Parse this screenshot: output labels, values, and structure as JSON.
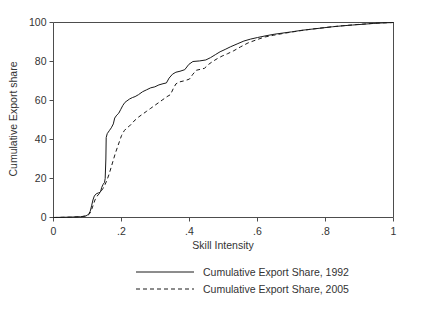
{
  "chart_data": {
    "type": "line",
    "title": "",
    "xlabel": "Skill Intensity",
    "ylabel": "Cumulative Export share",
    "xlim": [
      0,
      1
    ],
    "ylim": [
      0,
      100
    ],
    "xticks": [
      "0",
      ".2",
      ".4",
      ".6",
      ".8",
      "1"
    ],
    "xtick_values": [
      0,
      0.2,
      0.4,
      0.6,
      0.8,
      1
    ],
    "yticks": [
      "0",
      "20",
      "40",
      "60",
      "80",
      "100"
    ],
    "ytick_values": [
      0,
      20,
      40,
      60,
      80,
      100
    ],
    "grid": false,
    "legend_position": "below-axis",
    "line_color": "#1a1a1a",
    "background_color": "#ffffff",
    "series": [
      {
        "name": "Cumulative Export Share, 1992",
        "style": "solid",
        "points": [
          [
            0.0,
            0.0
          ],
          [
            0.05,
            0.2
          ],
          [
            0.08,
            0.4
          ],
          [
            0.095,
            0.8
          ],
          [
            0.1,
            1.2
          ],
          [
            0.104,
            2.0
          ],
          [
            0.108,
            3.2
          ],
          [
            0.112,
            6.0
          ],
          [
            0.116,
            9.0
          ],
          [
            0.12,
            11.0
          ],
          [
            0.126,
            12.2
          ],
          [
            0.132,
            12.6
          ],
          [
            0.138,
            13.0
          ],
          [
            0.142,
            15.5
          ],
          [
            0.146,
            17.0
          ],
          [
            0.15,
            18.0
          ],
          [
            0.152,
            20.0
          ],
          [
            0.154,
            30.0
          ],
          [
            0.155,
            41.0
          ],
          [
            0.158,
            43.0
          ],
          [
            0.164,
            44.5
          ],
          [
            0.17,
            46.0
          ],
          [
            0.176,
            48.0
          ],
          [
            0.18,
            51.0
          ],
          [
            0.186,
            52.5
          ],
          [
            0.192,
            53.5
          ],
          [
            0.198,
            55.5
          ],
          [
            0.204,
            57.5
          ],
          [
            0.21,
            59.0
          ],
          [
            0.216,
            59.8
          ],
          [
            0.224,
            60.8
          ],
          [
            0.232,
            61.5
          ],
          [
            0.24,
            62.0
          ],
          [
            0.25,
            63.0
          ],
          [
            0.262,
            64.5
          ],
          [
            0.274,
            65.5
          ],
          [
            0.286,
            66.5
          ],
          [
            0.298,
            67.0
          ],
          [
            0.31,
            68.0
          ],
          [
            0.322,
            68.6
          ],
          [
            0.332,
            69.0
          ],
          [
            0.34,
            71.5
          ],
          [
            0.35,
            73.5
          ],
          [
            0.36,
            74.5
          ],
          [
            0.372,
            75.0
          ],
          [
            0.386,
            75.8
          ],
          [
            0.398,
            78.5
          ],
          [
            0.41,
            80.0
          ],
          [
            0.43,
            80.3
          ],
          [
            0.448,
            80.8
          ],
          [
            0.462,
            82.0
          ],
          [
            0.476,
            83.5
          ],
          [
            0.49,
            85.0
          ],
          [
            0.505,
            86.2
          ],
          [
            0.52,
            87.5
          ],
          [
            0.54,
            89.0
          ],
          [
            0.56,
            90.5
          ],
          [
            0.58,
            91.5
          ],
          [
            0.6,
            92.3
          ],
          [
            0.625,
            93.2
          ],
          [
            0.65,
            94.0
          ],
          [
            0.675,
            94.6
          ],
          [
            0.7,
            95.2
          ],
          [
            0.73,
            96.0
          ],
          [
            0.76,
            96.6
          ],
          [
            0.79,
            97.2
          ],
          [
            0.82,
            97.8
          ],
          [
            0.85,
            98.3
          ],
          [
            0.88,
            98.7
          ],
          [
            0.91,
            99.1
          ],
          [
            0.94,
            99.5
          ],
          [
            0.97,
            99.8
          ],
          [
            1.0,
            100.0
          ]
        ]
      },
      {
        "name": "Cumulative Export Share, 2005",
        "style": "dashed",
        "points": [
          [
            0.0,
            0.0
          ],
          [
            0.05,
            0.2
          ],
          [
            0.08,
            0.4
          ],
          [
            0.098,
            0.8
          ],
          [
            0.104,
            1.5
          ],
          [
            0.11,
            3.0
          ],
          [
            0.116,
            6.0
          ],
          [
            0.122,
            9.0
          ],
          [
            0.128,
            11.0
          ],
          [
            0.134,
            12.0
          ],
          [
            0.14,
            13.5
          ],
          [
            0.146,
            15.0
          ],
          [
            0.152,
            17.0
          ],
          [
            0.158,
            19.5
          ],
          [
            0.164,
            22.5
          ],
          [
            0.17,
            26.0
          ],
          [
            0.176,
            29.5
          ],
          [
            0.182,
            33.0
          ],
          [
            0.188,
            36.0
          ],
          [
            0.194,
            39.0
          ],
          [
            0.2,
            42.0
          ],
          [
            0.208,
            44.5
          ],
          [
            0.216,
            46.0
          ],
          [
            0.224,
            47.0
          ],
          [
            0.232,
            48.5
          ],
          [
            0.24,
            50.0
          ],
          [
            0.25,
            51.5
          ],
          [
            0.262,
            53.0
          ],
          [
            0.274,
            54.5
          ],
          [
            0.286,
            56.0
          ],
          [
            0.298,
            57.5
          ],
          [
            0.31,
            59.0
          ],
          [
            0.322,
            60.5
          ],
          [
            0.334,
            62.0
          ],
          [
            0.344,
            63.0
          ],
          [
            0.352,
            66.0
          ],
          [
            0.36,
            68.5
          ],
          [
            0.37,
            69.5
          ],
          [
            0.382,
            70.0
          ],
          [
            0.392,
            70.5
          ],
          [
            0.4,
            71.0
          ],
          [
            0.41,
            73.5
          ],
          [
            0.42,
            75.5
          ],
          [
            0.432,
            76.0
          ],
          [
            0.444,
            76.5
          ],
          [
            0.456,
            78.5
          ],
          [
            0.468,
            80.0
          ],
          [
            0.482,
            81.5
          ],
          [
            0.496,
            82.8
          ],
          [
            0.512,
            84.0
          ],
          [
            0.53,
            85.5
          ],
          [
            0.55,
            87.5
          ],
          [
            0.572,
            89.5
          ],
          [
            0.595,
            91.0
          ],
          [
            0.62,
            92.5
          ],
          [
            0.648,
            93.5
          ],
          [
            0.676,
            94.4
          ],
          [
            0.704,
            95.2
          ],
          [
            0.734,
            96.0
          ],
          [
            0.764,
            96.7
          ],
          [
            0.794,
            97.3
          ],
          [
            0.824,
            97.9
          ],
          [
            0.856,
            98.4
          ],
          [
            0.888,
            98.9
          ],
          [
            0.92,
            99.3
          ],
          [
            0.952,
            99.7
          ],
          [
            1.0,
            100.0
          ]
        ]
      }
    ]
  },
  "legend": {
    "entries": [
      {
        "label": "Cumulative Export Share, 1992",
        "style": "solid"
      },
      {
        "label": "Cumulative Export Share, 2005",
        "style": "dashed"
      }
    ]
  }
}
